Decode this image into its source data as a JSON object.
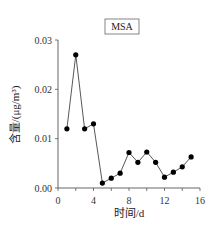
{
  "chart_data": {
    "type": "line",
    "title": "",
    "legend": [
      {
        "label": "MSA",
        "position": "top-center"
      }
    ],
    "xlabel": "时间/d",
    "ylabel": "含量/(μg/m³)",
    "xlim": [
      0,
      16
    ],
    "ylim": [
      0,
      0.03
    ],
    "xticks": [
      0,
      4,
      8,
      12,
      16
    ],
    "xtick_labels": [
      "0",
      "4",
      "8",
      "12",
      "16"
    ],
    "yticks": [
      0.0,
      0.01,
      0.02,
      0.03
    ],
    "ytick_labels": [
      "0.00",
      "0.01",
      "0.02",
      "0.03"
    ],
    "grid": false,
    "series": [
      {
        "name": "MSA",
        "marker": "filled-circle",
        "color": "#000000",
        "x": [
          1,
          2,
          3,
          4,
          5,
          6,
          7,
          8,
          9,
          10,
          11,
          12,
          13,
          14,
          15
        ],
        "values": [
          0.012,
          0.027,
          0.012,
          0.013,
          0.001,
          0.002,
          0.003,
          0.0072,
          0.0052,
          0.0073,
          0.0052,
          0.0022,
          0.0032,
          0.0043,
          0.0063
        ]
      }
    ]
  }
}
